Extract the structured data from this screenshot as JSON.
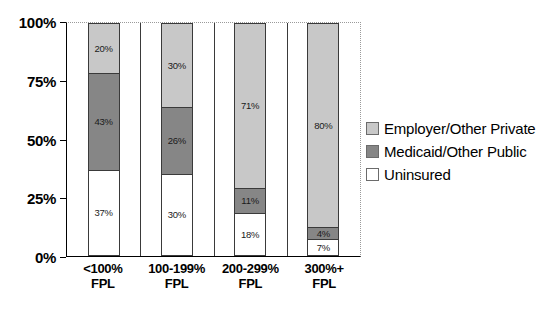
{
  "chart_data": {
    "type": "bar",
    "stacked": true,
    "title": "",
    "subtitle": "",
    "xlabel": "",
    "ylabel": "",
    "ylim": [
      0,
      100
    ],
    "ytick_labels": [
      "0%",
      "25%",
      "50%",
      "75%",
      "100%"
    ],
    "ytick_values": [
      0,
      25,
      50,
      75,
      100
    ],
    "grid": false,
    "legend_position": "right",
    "categories": [
      "<100% FPL",
      "100-199% FPL",
      "200-299% FPL",
      "300%+ FPL"
    ],
    "category_lines": [
      [
        "<100%",
        "FPL"
      ],
      [
        "100-199%",
        "FPL"
      ],
      [
        "200-299%",
        "FPL"
      ],
      [
        "300%+",
        "FPL"
      ]
    ],
    "series": [
      {
        "name": "Employer/Other Private",
        "color": "#c8c8c8",
        "values": [
          20,
          30,
          71,
          80
        ],
        "labels": [
          "20%",
          "30%",
          "71%",
          "80%"
        ]
      },
      {
        "name": "Medicaid/Other Public",
        "color": "#868686",
        "values": [
          43,
          26,
          11,
          4
        ],
        "labels": [
          "43%",
          "26%",
          "11%",
          "4%"
        ]
      },
      {
        "name": "Uninsured",
        "color": "#ffffff",
        "values": [
          37,
          30,
          18,
          7
        ],
        "labels": [
          "37%",
          "30%",
          "18%",
          "7%"
        ]
      }
    ],
    "stack_order_top_to_bottom": [
      "Employer/Other Private",
      "Medicaid/Other Public",
      "Uninsured"
    ],
    "bars": [
      {
        "category": "<100% FPL",
        "segments": [
          {
            "series": "Employer/Other Private",
            "value": 20,
            "label": "20%",
            "draw_height_pct": 21,
            "style": "light"
          },
          {
            "series": "Medicaid/Other Public",
            "value": 43,
            "label": "43%",
            "draw_height_pct": 42,
            "style": "dark"
          },
          {
            "series": "Uninsured",
            "value": 37,
            "label": "37%",
            "draw_height_pct": 37,
            "style": "white"
          }
        ]
      },
      {
        "category": "100-199% FPL",
        "segments": [
          {
            "series": "Employer/Other Private",
            "value": 30,
            "label": "30%",
            "draw_height_pct": 36,
            "style": "light"
          },
          {
            "series": "Medicaid/Other Public",
            "value": 26,
            "label": "26%",
            "draw_height_pct": 29,
            "style": "dark"
          },
          {
            "series": "Uninsured",
            "value": 30,
            "label": "30%",
            "draw_height_pct": 35,
            "style": "white"
          }
        ]
      },
      {
        "category": "200-299% FPL",
        "segments": [
          {
            "series": "Employer/Other Private",
            "value": 71,
            "label": "71%",
            "draw_height_pct": 71,
            "style": "light"
          },
          {
            "series": "Medicaid/Other Public",
            "value": 11,
            "label": "11%",
            "draw_height_pct": 11,
            "style": "dark"
          },
          {
            "series": "Uninsured",
            "value": 18,
            "label": "18%",
            "draw_height_pct": 18,
            "style": "white"
          }
        ]
      },
      {
        "category": "300%+ FPL",
        "segments": [
          {
            "series": "Employer/Other Private",
            "value": 80,
            "label": "80%",
            "draw_height_pct": 88,
            "style": "light"
          },
          {
            "series": "Medicaid/Other Public",
            "value": 4,
            "label": "4%",
            "draw_height_pct": 5,
            "style": "dark"
          },
          {
            "series": "Uninsured",
            "value": 7,
            "label": "7%",
            "draw_height_pct": 7,
            "style": "white"
          }
        ]
      }
    ]
  },
  "legend": {
    "items": [
      {
        "label": "Employer/Other Private",
        "style": "light"
      },
      {
        "label": "Medicaid/Other Public",
        "style": "dark"
      },
      {
        "label": "Uninsured",
        "style": "white"
      }
    ]
  },
  "colors": {
    "employer_private": "#c8c8c8",
    "medicaid_public": "#868686",
    "uninsured": "#ffffff",
    "axis": "#000000",
    "frame_dotted": "#9a9a9a"
  }
}
